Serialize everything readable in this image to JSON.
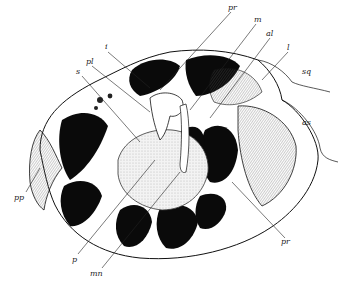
{
  "figure": {
    "type": "anatomical-line-drawing",
    "labels": [
      {
        "id": "pr_top",
        "text": "pr",
        "x": 230,
        "y": 6,
        "line": [
          231,
          12,
          160,
          90
        ]
      },
      {
        "id": "m",
        "text": "m",
        "x": 256,
        "y": 18,
        "line": [
          256,
          24,
          190,
          110
        ]
      },
      {
        "id": "al",
        "text": "al",
        "x": 268,
        "y": 32,
        "line": [
          270,
          38,
          210,
          118
        ]
      },
      {
        "id": "l",
        "text": "l",
        "x": 288,
        "y": 46,
        "line": [
          288,
          52,
          262,
          80
        ]
      },
      {
        "id": "sq",
        "text": "sq",
        "x": 303,
        "y": 70,
        "line": null
      },
      {
        "id": "as",
        "text": "as",
        "x": 304,
        "y": 120,
        "line": null
      },
      {
        "id": "i",
        "text": "i",
        "x": 106,
        "y": 45,
        "line": [
          108,
          52,
          150,
          88
        ]
      },
      {
        "id": "pl",
        "text": "pl",
        "x": 88,
        "y": 60,
        "line": [
          92,
          66,
          150,
          112
        ]
      },
      {
        "id": "s",
        "text": "s",
        "x": 78,
        "y": 70,
        "line": [
          82,
          76,
          140,
          142
        ]
      },
      {
        "id": "pp",
        "text": "pp",
        "x": 18,
        "y": 196,
        "line": [
          26,
          192,
          40,
          168
        ]
      },
      {
        "id": "p",
        "text": "p",
        "x": 74,
        "y": 258,
        "line": [
          78,
          254,
          155,
          160
        ]
      },
      {
        "id": "mn",
        "text": "mn",
        "x": 93,
        "y": 272,
        "line": [
          102,
          268,
          180,
          172
        ]
      },
      {
        "id": "pr_bottom",
        "text": "pr",
        "x": 282,
        "y": 240,
        "line": [
          285,
          238,
          232,
          182
        ]
      }
    ]
  },
  "colors": {
    "ink": "#111111",
    "background": "#ffffff",
    "stipple": "#888888",
    "shade": "#cfcfcf"
  }
}
